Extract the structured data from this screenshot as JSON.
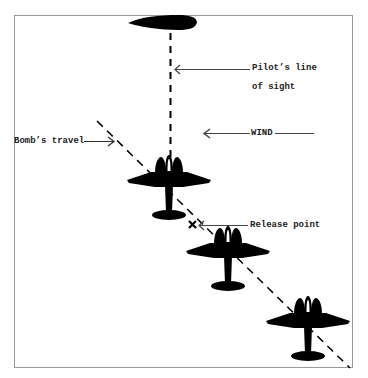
{
  "diagram": {
    "type": "bomb-release illustration",
    "labels": {
      "sight_line_1": "Pilot’s line",
      "sight_line_2": "of sight",
      "wind": "WIND",
      "bombs_travel": "Bomb’s travel",
      "release_point": "Release point",
      "release_marker": "×"
    },
    "elements": {
      "aircraft_count": 4,
      "top_aircraft": "side-profile-fuselage",
      "formation_aircraft": [
        "plane-1",
        "plane-2",
        "plane-3"
      ]
    },
    "colors": {
      "ink": "#000000",
      "frame": "#999999",
      "background": "#ffffff"
    }
  }
}
